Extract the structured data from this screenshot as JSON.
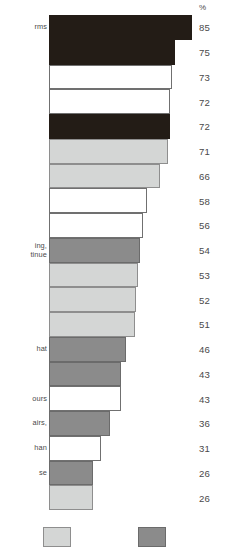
{
  "chart_data": {
    "type": "bar",
    "title": "",
    "subtitle": "",
    "xlabel": "",
    "ylabel": "",
    "orientation": "horizontal",
    "value_axis_header": "%",
    "value_suffix": "%",
    "xlim": [
      0,
      85
    ],
    "grid": false,
    "legend_position": "bottom",
    "categories": [
      "rms",
      "",
      "",
      "",
      "",
      "",
      "",
      "",
      "ing,\ntinue",
      "",
      "",
      "",
      "",
      "hat",
      "",
      "ours",
      "airs,",
      "han",
      "se",
      ""
    ],
    "values": [
      85,
      75,
      73,
      72,
      72,
      71,
      66,
      58,
      56,
      54,
      53,
      52,
      51,
      46,
      43,
      43,
      36,
      31,
      26,
      26
    ],
    "bar_styles": [
      "black",
      "black",
      "white",
      "white",
      "black",
      "light",
      "light",
      "white",
      "white",
      "medium",
      "light",
      "light",
      "light",
      "medium",
      "medium",
      "white",
      "medium",
      "white",
      "medium",
      "light"
    ],
    "series": [
      {
        "name": "",
        "values": [
          85,
          75,
          73,
          72,
          72,
          71,
          66,
          58,
          56,
          54,
          53,
          52,
          51,
          46,
          43,
          43,
          36,
          31,
          26,
          26
        ]
      }
    ],
    "legend": [
      {
        "label": "",
        "color": "#d4d6d5",
        "style": "light"
      },
      {
        "label": "",
        "color": "#8b8b8b",
        "style": "medium"
      }
    ],
    "colors": {
      "black": "#231c16",
      "white": "#ffffff",
      "light_gray": "#d4d6d5",
      "medium_gray": "#8b8b8b",
      "outline": "#6e6e6e",
      "text": "#4a4a4a"
    },
    "note": "Horizontal bar chart; category labels are cropped at the left image edge and legend labels are cropped at the bottom edge."
  },
  "rows": [
    {
      "label": "rms",
      "value": "85",
      "style": "black"
    },
    {
      "label": "",
      "value": "75",
      "style": "black"
    },
    {
      "label": "",
      "value": "73",
      "style": "white"
    },
    {
      "label": "",
      "value": "72",
      "style": "white"
    },
    {
      "label": "",
      "value": "72",
      "style": "black"
    },
    {
      "label": "",
      "value": "71",
      "style": "light"
    },
    {
      "label": "",
      "value": "66",
      "style": "light"
    },
    {
      "label": "",
      "value": "58",
      "style": "white"
    },
    {
      "label": "",
      "value": "56",
      "style": "white"
    },
    {
      "label": "ing,\ntinue",
      "value": "54",
      "style": "medium"
    },
    {
      "label": "",
      "value": "53",
      "style": "light"
    },
    {
      "label": "",
      "value": "52",
      "style": "light"
    },
    {
      "label": "",
      "value": "51",
      "style": "light"
    },
    {
      "label": "hat",
      "value": "46",
      "style": "medium"
    },
    {
      "label": "",
      "value": "43",
      "style": "medium"
    },
    {
      "label": "ours",
      "value": "43",
      "style": "white"
    },
    {
      "label": "airs,",
      "value": "36",
      "style": "medium"
    },
    {
      "label": "han",
      "value": "31",
      "style": "white"
    },
    {
      "label": "se",
      "value": "26",
      "style": "medium"
    },
    {
      "label": "",
      "value": "26",
      "style": "light"
    }
  ],
  "axis": {
    "percent_symbol": "%"
  },
  "legend": {
    "items": [
      {
        "name": "legend-swatch-light",
        "label": ""
      },
      {
        "name": "legend-swatch-medium",
        "label": ""
      }
    ]
  }
}
